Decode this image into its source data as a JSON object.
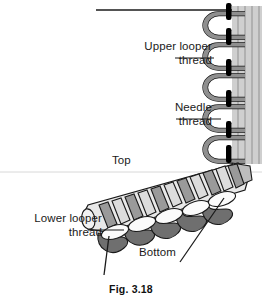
{
  "figure": {
    "caption": "Fig. 3.18",
    "type": "overlock-stitch-cross-section-diagram"
  },
  "labels": {
    "upper_looper": {
      "line1": "Upper looper",
      "line2": "thread"
    },
    "needle": {
      "line1": "Needle",
      "line2": "thread"
    },
    "lower_looper": {
      "line1": "Lower looper",
      "line2": "thread"
    },
    "top": "Top",
    "bottom": "Bottom"
  },
  "colors": {
    "background": "#ffffff",
    "outline": "#1a1a1a",
    "needle_thread": "#000000",
    "upper_looper_thread": "#8f8f8f",
    "lower_looper_thread": "#6f6f6f",
    "fabric_light": "#e0e0e0",
    "fabric_mid": "#b5b5b5",
    "fabric_dark": "#8a8a8a",
    "leader_line": "#1a1a1a",
    "text": "#1a1a1a"
  },
  "geometry": {
    "top_edge_line_y": 10,
    "top_edge_line_x1": 96,
    "top_edge_line_x2": 262,
    "fold_line_y": 172,
    "upper_loop_count": 5,
    "needle_bar_count": 6,
    "diagonal_stitch_count": 11,
    "lower_loop_count": 6
  }
}
